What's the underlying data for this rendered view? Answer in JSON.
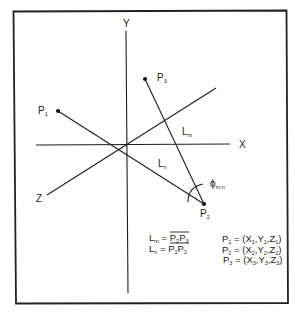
{
  "diagram": {
    "title": "",
    "axes": {
      "x_label": "X",
      "y_label": "Y",
      "z_label": "Z"
    },
    "points": [
      {
        "id": "P1",
        "base": "P",
        "sub": "1"
      },
      {
        "id": "P2",
        "base": "P",
        "sub": "2"
      },
      {
        "id": "P3",
        "base": "P",
        "sub": "3"
      }
    ],
    "segments": [
      {
        "id": "Lm",
        "base": "L",
        "sub": "m",
        "from": "P2",
        "to": "P3"
      },
      {
        "id": "Ln",
        "base": "L",
        "sub": "n",
        "from": "P1",
        "to": "P2"
      }
    ],
    "angle": {
      "base": "ϕ",
      "sub": "m,n",
      "vertex": "P2"
    },
    "definitions": {
      "lm_lhs": "L",
      "lm_lhs_sub": "m",
      "lm_eq": " = ",
      "lm_p_a": "P",
      "lm_p_a_sub": "2",
      "lm_p_b": "P",
      "lm_p_b_sub": "3",
      "ln_lhs": "L",
      "ln_lhs_sub": "n",
      "ln_eq": " = ",
      "ln_p_a": "P",
      "ln_p_a_sub": "1",
      "ln_p_b": "P",
      "ln_p_b_sub": "2"
    },
    "coordinates": [
      {
        "p": "P",
        "ps": "1",
        "eq": " = (X",
        "xs": "1",
        "y": ",Y",
        "ys": "1",
        "z": ",Z",
        "zs": "1",
        "close": ")"
      },
      {
        "p": "P",
        "ps": "2",
        "eq": " = (X",
        "xs": "2",
        "y": ",Y",
        "ys": "2",
        "z": ",Z",
        "zs": "2",
        "close": ")"
      },
      {
        "p": "P",
        "ps": "3",
        "eq": " = (X",
        "xs": "3",
        "y": ",Y",
        "ys": "3",
        "z": ",Z",
        "zs": "3",
        "close": ")"
      }
    ]
  }
}
